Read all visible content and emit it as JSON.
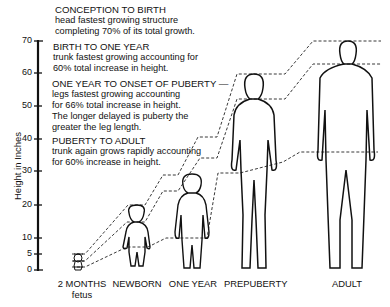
{
  "annotations": [
    {
      "heading": "CONCEPTION TO BIRTH",
      "lines": [
        "head fastest growing structure",
        "completing 70% of its total growth."
      ]
    },
    {
      "heading": "BIRTH TO ONE YEAR",
      "lines": [
        "trunk fastest growing accounting for",
        "60% total increase in height."
      ]
    },
    {
      "heading": "ONE YEAR TO ONSET OF PUBERTY —",
      "lines": [
        "legs fastest growing accounting",
        "for 66% total increase in height.",
        "The longer delayed is puberty the",
        "greater the leg length."
      ]
    },
    {
      "heading": "PUBERTY TO ADULT",
      "lines": [
        "trunk again grows rapidly accounting",
        "for 60% increase in height."
      ]
    }
  ],
  "axis": {
    "label": "Height in Inches",
    "ticks": [
      "70",
      "60",
      "50",
      "40",
      "30",
      "20",
      "10",
      "5",
      "0"
    ]
  },
  "stages": [
    {
      "label": "2 MONTHS",
      "sublabel": "fetus"
    },
    {
      "label": "NEWBORN",
      "sublabel": ""
    },
    {
      "label": "ONE YEAR",
      "sublabel": ""
    },
    {
      "label": "PREPUBERTY",
      "sublabel": ""
    },
    {
      "label": "ADULT",
      "sublabel": ""
    }
  ]
}
